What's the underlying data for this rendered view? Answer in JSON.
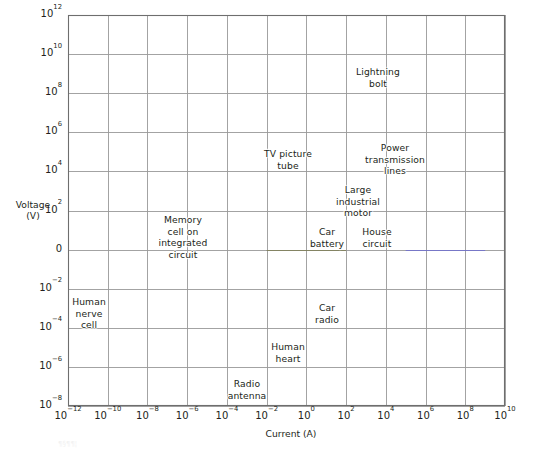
{
  "chart_data": {
    "type": "scatter",
    "title": "",
    "xlabel": "Current (A)",
    "ylabel": "Voltage\n(V)",
    "xscale": "log",
    "yscale": "log",
    "xlim": [
      1e-12,
      10000000000.0
    ],
    "ylim": [
      1e-08,
      1000000000000.0
    ],
    "grid": true,
    "legend": null,
    "x_ticks": [
      {
        "value": 1e-12,
        "mantissa": "10",
        "exponent": "−12"
      },
      {
        "value": 1e-10,
        "mantissa": "10",
        "exponent": "−10"
      },
      {
        "value": 1e-08,
        "mantissa": "10",
        "exponent": "−8"
      },
      {
        "value": 1e-06,
        "mantissa": "10",
        "exponent": "−6"
      },
      {
        "value": 0.0001,
        "mantissa": "10",
        "exponent": "−4"
      },
      {
        "value": 0.01,
        "mantissa": "10",
        "exponent": "−2"
      },
      {
        "value": 1,
        "mantissa": "10",
        "exponent": "0"
      },
      {
        "value": 100,
        "mantissa": "10",
        "exponent": "2"
      },
      {
        "value": 10000,
        "mantissa": "10",
        "exponent": "4"
      },
      {
        "value": 1000000.0,
        "mantissa": "10",
        "exponent": "6"
      },
      {
        "value": 100000000.0,
        "mantissa": "10",
        "exponent": "8"
      },
      {
        "value": 10000000000.0,
        "mantissa": "10",
        "exponent": "10"
      }
    ],
    "y_ticks": [
      {
        "value": 1000000000000.0,
        "mantissa": "10",
        "exponent": "12"
      },
      {
        "value": 10000000000.0,
        "mantissa": "10",
        "exponent": "10"
      },
      {
        "value": 100000000.0,
        "mantissa": "10",
        "exponent": "8"
      },
      {
        "value": 1000000.0,
        "mantissa": "10",
        "exponent": "6"
      },
      {
        "value": 10000.0,
        "mantissa": "10",
        "exponent": "4"
      },
      {
        "value": 100.0,
        "mantissa": "10",
        "exponent": "2"
      },
      {
        "value": 1,
        "mantissa": "0",
        "exponent": ""
      },
      {
        "value": 0.01,
        "mantissa": "10",
        "exponent": "−2"
      },
      {
        "value": 0.0001,
        "mantissa": "10",
        "exponent": "−4"
      },
      {
        "value": 1e-06,
        "mantissa": "10",
        "exponent": "−6"
      },
      {
        "value": 1e-08,
        "mantissa": "10",
        "exponent": "−8"
      }
    ],
    "annotations": [
      {
        "label": "Lightning\nbolt",
        "x": 100.0,
        "y": 500000000.0,
        "cell_x": 378,
        "cell_y": 66
      },
      {
        "label": "TV picture\ntube",
        "x": 0.01,
        "y": 50000.0,
        "cell_x": 288,
        "cell_y": 148
      },
      {
        "label": "Power\ntransmission\nlines",
        "x": 100.0,
        "y": 50000.0,
        "cell_x": 395,
        "cell_y": 142
      },
      {
        "label": "Large\nindustrial\nmotor",
        "x": 100.0,
        "y": 500.0,
        "cell_x": 358,
        "cell_y": 184
      },
      {
        "label": "Memory\ncell on\nintegrated\ncircuit",
        "x": 1e-08,
        "y": 5.0,
        "cell_x": 183,
        "cell_y": 214
      },
      {
        "label": "Car\nbattery",
        "x": 1.0,
        "y": 5.0,
        "cell_x": 327,
        "cell_y": 226
      },
      {
        "label": "House\ncircuit",
        "x": 100.0,
        "y": 5.0,
        "cell_x": 377,
        "cell_y": 226
      },
      {
        "label": "Human\nnerve\ncell",
        "x": 1e-12,
        "y": 0.005,
        "cell_x": 89,
        "cell_y": 296
      },
      {
        "label": "Car\nradio",
        "x": 1.0,
        "y": 0.005,
        "cell_x": 327,
        "cell_y": 302
      },
      {
        "label": "Human\nheart",
        "x": 0.01,
        "y": 5e-05,
        "cell_x": 288,
        "cell_y": 341
      },
      {
        "label": "Radio\nantenna",
        "x": 0.0001,
        "y": 5e-07,
        "cell_x": 247,
        "cell_y": 378
      }
    ],
    "colors": {
      "background": "#ffffff",
      "grid": "#999999",
      "frame": "#6e6e6e",
      "text": "#231f20",
      "highlight_olive": "#6b6b30",
      "highlight_blue": "#5a5adf"
    }
  },
  "footnote": {
    "text": "¶§¶¶¦"
  }
}
